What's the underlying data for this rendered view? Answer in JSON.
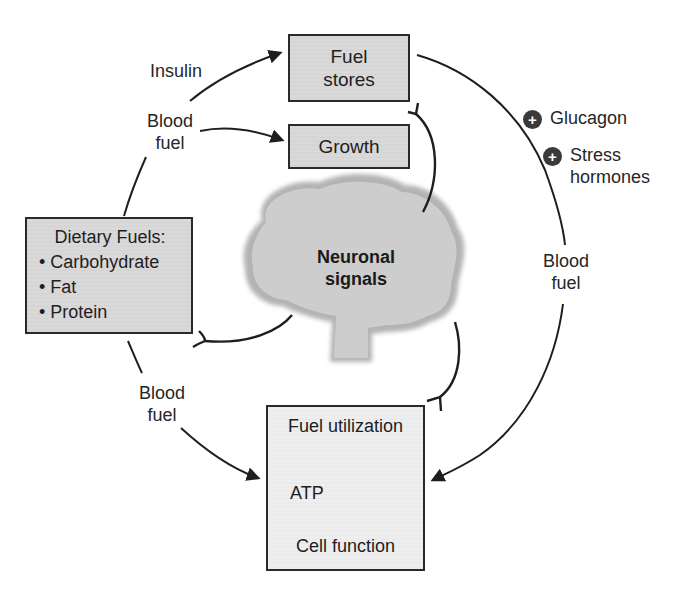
{
  "diagram": {
    "nodes": {
      "fuel_stores": {
        "line1": "Fuel",
        "line2": "stores"
      },
      "growth": {
        "label": "Growth"
      },
      "dietary_fuels": {
        "title": "Dietary Fuels:",
        "items": [
          "Carbohydrate",
          "Fat",
          "Protein"
        ]
      },
      "neuronal_signals": {
        "line1": "Neuronal",
        "line2": "signals"
      },
      "fuel_utilization": {
        "title": "Fuel utilization",
        "atp": "ATP",
        "cell_function": "Cell function"
      }
    },
    "edge_labels": {
      "insulin": "Insulin",
      "blood_fuel_top_line1": "Blood",
      "blood_fuel_top_line2": "fuel",
      "blood_fuel_bottom_line1": "Blood",
      "blood_fuel_bottom_line2": "fuel",
      "blood_fuel_right_line1": "Blood",
      "blood_fuel_right_line2": "fuel"
    },
    "modulators": [
      {
        "sign": "+",
        "label": "Glucagon"
      },
      {
        "sign": "+",
        "line1": "Stress",
        "line2": "hormones"
      }
    ],
    "colors": {
      "box_fill": "#d9d9d9",
      "utilization_fill": "#efefef",
      "brain_fill": "#c4c4c4",
      "stroke": "#1e1e1e",
      "modulator_badge": "#3a3a3a"
    }
  },
  "caption": {
    "visible_text": ""
  }
}
